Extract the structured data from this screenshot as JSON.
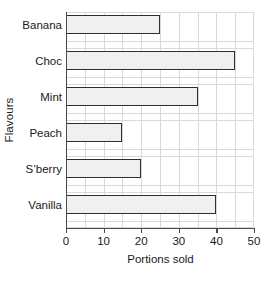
{
  "chart_data": {
    "type": "bar",
    "orientation": "horizontal",
    "title": "",
    "categories": [
      "Banana",
      "Choc",
      "Mint",
      "Peach",
      "S’berry",
      "Vanilla"
    ],
    "values": [
      25,
      45,
      35,
      15,
      20,
      40
    ],
    "xlabel": "Portions sold",
    "ylabel": "Flavours",
    "xlim": [
      0,
      50
    ],
    "xticks": [
      0,
      10,
      20,
      30,
      40,
      50
    ],
    "xtick_labels": [
      "0",
      "10",
      "20",
      "30",
      "40",
      "50"
    ],
    "minor_gridline_step": 5,
    "grid": true,
    "legend": null,
    "bar_fill_color": "#f0f0f0",
    "bar_edge_color": "#2e2e2e",
    "gridline_color": "#d9d9d9",
    "axis_color": "#4a4a4a"
  }
}
